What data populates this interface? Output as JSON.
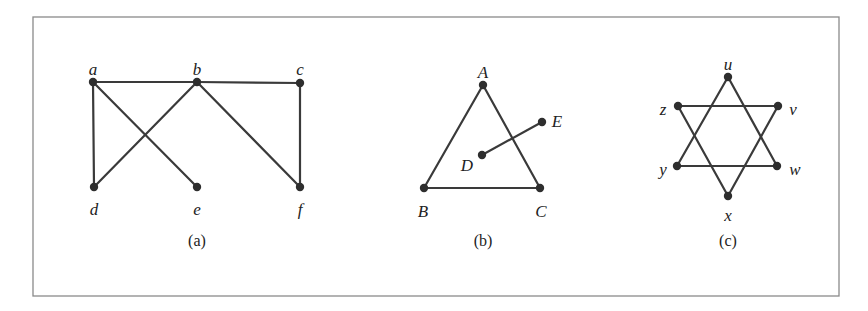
{
  "figure": {
    "frame": {
      "x": 33,
      "y": 17,
      "width": 806,
      "height": 279,
      "color": "#8a8a8a"
    },
    "edge_color": "#3a3a3a",
    "node_color": "#2e2e2e",
    "graphs": [
      {
        "id": "a",
        "caption": "(a)",
        "caption_pos": [
          197,
          246
        ],
        "vertices": [
          {
            "name": "a",
            "x": 93,
            "y": 82,
            "lx": 93,
            "ly": 71
          },
          {
            "name": "b",
            "x": 197,
            "y": 82,
            "lx": 197,
            "ly": 71
          },
          {
            "name": "c",
            "x": 300,
            "y": 83,
            "lx": 300,
            "ly": 71
          },
          {
            "name": "d",
            "x": 94,
            "y": 187,
            "lx": 94,
            "ly": 211
          },
          {
            "name": "e",
            "x": 197,
            "y": 187,
            "lx": 197,
            "ly": 211
          },
          {
            "name": "f",
            "x": 300,
            "y": 187,
            "lx": 300,
            "ly": 211
          }
        ],
        "edges": [
          [
            "a",
            "b"
          ],
          [
            "b",
            "c"
          ],
          [
            "a",
            "d"
          ],
          [
            "a",
            "e"
          ],
          [
            "b",
            "d"
          ],
          [
            "b",
            "f"
          ],
          [
            "c",
            "f"
          ]
        ]
      },
      {
        "id": "b",
        "caption": "(b)",
        "caption_pos": [
          483,
          246
        ],
        "vertices": [
          {
            "name": "A",
            "x": 483,
            "y": 85,
            "lx": 483,
            "ly": 74
          },
          {
            "name": "B",
            "x": 424,
            "y": 188,
            "lx": 423,
            "ly": 213
          },
          {
            "name": "C",
            "x": 540,
            "y": 188,
            "lx": 541,
            "ly": 213
          },
          {
            "name": "D",
            "x": 482,
            "y": 155,
            "lx": 467,
            "ly": 167
          },
          {
            "name": "E",
            "x": 542,
            "y": 122,
            "lx": 557,
            "ly": 123
          }
        ],
        "edges": [
          [
            "A",
            "B"
          ],
          [
            "A",
            "C"
          ],
          [
            "B",
            "C"
          ],
          [
            "D",
            "E"
          ]
        ]
      },
      {
        "id": "c",
        "caption": "(c)",
        "caption_pos": [
          728,
          246
        ],
        "vertices": [
          {
            "name": "u",
            "x": 728,
            "y": 77,
            "lx": 728,
            "ly": 66
          },
          {
            "name": "v",
            "x": 778,
            "y": 106,
            "lx": 793,
            "ly": 111
          },
          {
            "name": "w",
            "x": 777,
            "y": 166,
            "lx": 795,
            "ly": 171
          },
          {
            "name": "x",
            "x": 728,
            "y": 196,
            "lx": 728,
            "ly": 217
          },
          {
            "name": "y",
            "x": 677,
            "y": 166,
            "lx": 663,
            "ly": 171
          },
          {
            "name": "z",
            "x": 678,
            "y": 106,
            "lx": 663,
            "ly": 111
          }
        ],
        "edges": [
          [
            "u",
            "y"
          ],
          [
            "u",
            "w"
          ],
          [
            "y",
            "w"
          ],
          [
            "z",
            "v"
          ],
          [
            "z",
            "x"
          ],
          [
            "v",
            "x"
          ]
        ]
      }
    ]
  }
}
